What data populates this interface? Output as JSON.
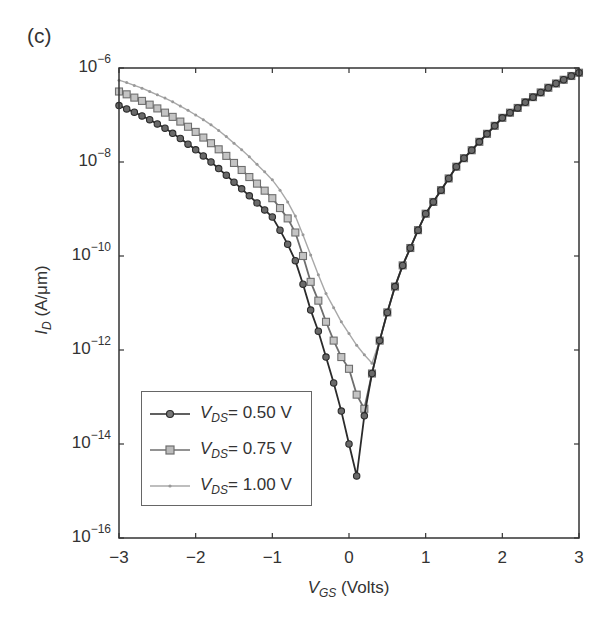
{
  "panel_label": "(c)",
  "chart_data": {
    "type": "line",
    "title": "",
    "panel": "(c)",
    "xlabel": "V_GS (Volts)",
    "xlabel_parts": {
      "var": "V",
      "sub": "GS",
      "unit": "(Volts)"
    },
    "ylabel": "I_D (A/μm)",
    "ylabel_parts": {
      "var": "I",
      "sub": "D",
      "unit": "(A/μm)"
    },
    "xlim": [
      -3,
      3
    ],
    "ylim": [
      1e-16,
      1e-06
    ],
    "yscale": "log",
    "grid": false,
    "legend_position": "lower left (inside)",
    "x_ticks": [
      -3,
      -2,
      -1,
      0,
      1,
      2,
      3
    ],
    "x_tick_labels": [
      "−3",
      "−2",
      "−1",
      "0",
      "1",
      "2",
      "3"
    ],
    "y_tick_exponents": [
      -6,
      -8,
      -10,
      -12,
      -14,
      -16
    ],
    "y_tick_labels": [
      "10^-6",
      "10^-8",
      "10^-10",
      "10^-12",
      "10^-14",
      "10^-16"
    ],
    "value_encoding": "series values are log10(I_D in A/μm) sampled at V_GS = -3.0 to 3.0 step 0.1",
    "x": [
      -3.0,
      -2.9,
      -2.8,
      -2.7,
      -2.6,
      -2.5,
      -2.4,
      -2.3,
      -2.2,
      -2.1,
      -2.0,
      -1.9,
      -1.8,
      -1.7,
      -1.6,
      -1.5,
      -1.4,
      -1.3,
      -1.2,
      -1.1,
      -1.0,
      -0.9,
      -0.8,
      -0.7,
      -0.6,
      -0.5,
      -0.4,
      -0.3,
      -0.2,
      -0.1,
      0.0,
      0.1,
      0.2,
      0.3,
      0.4,
      0.5,
      0.6,
      0.7,
      0.8,
      0.9,
      1.0,
      1.1,
      1.2,
      1.3,
      1.4,
      1.5,
      1.6,
      1.7,
      1.8,
      1.9,
      2.0,
      2.1,
      2.2,
      2.3,
      2.4,
      2.5,
      2.6,
      2.7,
      2.8,
      2.9,
      3.0
    ],
    "series": [
      {
        "name": "V_DS = 0.50 V",
        "label_parts": {
          "var": "V",
          "sub": "DS",
          "value": "= 0.50 V"
        },
        "marker": "circle",
        "color": "#2b2b2b",
        "log10_values": [
          -6.8,
          -6.87,
          -6.94,
          -7.02,
          -7.1,
          -7.19,
          -7.28,
          -7.39,
          -7.5,
          -7.62,
          -7.74,
          -7.87,
          -8.0,
          -8.14,
          -8.28,
          -8.43,
          -8.57,
          -8.72,
          -8.87,
          -9.02,
          -9.17,
          -9.45,
          -9.75,
          -10.1,
          -10.6,
          -11.15,
          -11.6,
          -12.15,
          -12.7,
          -13.3,
          -14.0,
          -14.68,
          -13.4,
          -12.5,
          -11.8,
          -11.2,
          -10.65,
          -10.2,
          -9.83,
          -9.45,
          -9.1,
          -8.85,
          -8.6,
          -8.35,
          -8.1,
          -7.92,
          -7.75,
          -7.57,
          -7.4,
          -7.23,
          -7.06,
          -6.95,
          -6.85,
          -6.73,
          -6.62,
          -6.52,
          -6.42,
          -6.33,
          -6.25,
          -6.17,
          -6.1
        ]
      },
      {
        "name": "V_DS = 0.75 V",
        "label_parts": {
          "var": "V",
          "sub": "DS",
          "value": "= 0.75 V"
        },
        "marker": "square",
        "color": "#6e6e6e",
        "log10_values": [
          -6.5,
          -6.56,
          -6.63,
          -6.7,
          -6.78,
          -6.86,
          -6.95,
          -7.04,
          -7.14,
          -7.25,
          -7.36,
          -7.48,
          -7.6,
          -7.73,
          -7.87,
          -8.02,
          -8.17,
          -8.32,
          -8.46,
          -8.61,
          -8.77,
          -8.98,
          -9.2,
          -9.5,
          -10.0,
          -10.55,
          -10.95,
          -11.4,
          -11.8,
          -12.15,
          -12.4,
          -12.95,
          -13.25,
          -12.5,
          -11.8,
          -11.2,
          -10.65,
          -10.2,
          -9.83,
          -9.45,
          -9.1,
          -8.85,
          -8.6,
          -8.35,
          -8.1,
          -7.92,
          -7.75,
          -7.57,
          -7.4,
          -7.23,
          -7.06,
          -6.95,
          -6.85,
          -6.73,
          -6.62,
          -6.52,
          -6.42,
          -6.33,
          -6.25,
          -6.17,
          -6.1
        ]
      },
      {
        "name": "V_DS = 1.00 V",
        "label_parts": {
          "var": "V",
          "sub": "DS",
          "value": "= 1.00 V"
        },
        "marker": "dot",
        "color": "#a8a8a8",
        "log10_values": [
          -6.26,
          -6.31,
          -6.37,
          -6.43,
          -6.5,
          -6.57,
          -6.64,
          -6.72,
          -6.81,
          -6.9,
          -7.0,
          -7.1,
          -7.21,
          -7.33,
          -7.46,
          -7.6,
          -7.74,
          -7.89,
          -8.05,
          -8.21,
          -8.38,
          -8.6,
          -8.85,
          -9.15,
          -9.55,
          -9.98,
          -10.4,
          -10.8,
          -11.1,
          -11.4,
          -11.65,
          -11.9,
          -12.1,
          -12.28,
          -11.8,
          -11.2,
          -10.65,
          -10.2,
          -9.83,
          -9.45,
          -9.1,
          -8.85,
          -8.6,
          -8.35,
          -8.1,
          -7.92,
          -7.75,
          -7.57,
          -7.4,
          -7.23,
          -7.06,
          -6.95,
          -6.85,
          -6.73,
          -6.62,
          -6.52,
          -6.42,
          -6.33,
          -6.25,
          -6.17,
          -6.1
        ]
      }
    ],
    "annotations": [
      {
        "text": "(c)",
        "position": "top-left"
      }
    ],
    "layout": {
      "plot_left": 119,
      "plot_right": 579,
      "plot_top": 68,
      "plot_bottom": 538
    }
  }
}
